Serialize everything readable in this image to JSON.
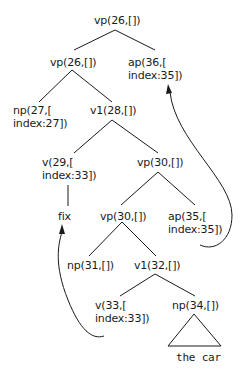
{
  "diagram": {
    "type": "syntax-tree",
    "nodes": {
      "root": {
        "label": "vp(26,[])"
      },
      "vp26": {
        "label": "vp(26,[])"
      },
      "ap36": {
        "line1": "ap(36,[",
        "line2": "index:35])"
      },
      "np27": {
        "line1": "np(27,[",
        "line2": "index:27])"
      },
      "v1_28": {
        "label": "v1(28,[])"
      },
      "v29": {
        "line1": "v(29,[",
        "line2": "index:33])"
      },
      "vp30": {
        "label": "vp(30,[])"
      },
      "fix": {
        "label": "fix"
      },
      "vp30_inner": {
        "label": "vp(30,[])"
      },
      "ap35": {
        "line1": "ap(35,[",
        "line2": "index:35])"
      },
      "np31": {
        "label": "np(31,[])"
      },
      "v1_32": {
        "label": "v1(32,[])"
      },
      "v33": {
        "line1": "v(33,[",
        "line2": "index:33])"
      },
      "np34": {
        "label": "np(34,[])"
      },
      "the_car": {
        "label": "the car"
      }
    },
    "edges": [
      [
        "root",
        "vp26"
      ],
      [
        "root",
        "ap36"
      ],
      [
        "vp26",
        "np27"
      ],
      [
        "vp26",
        "v1_28"
      ],
      [
        "v1_28",
        "v29"
      ],
      [
        "v1_28",
        "vp30"
      ],
      [
        "v29",
        "fix"
      ],
      [
        "vp30",
        "vp30_inner"
      ],
      [
        "vp30",
        "ap35"
      ],
      [
        "vp30_inner",
        "np31"
      ],
      [
        "vp30_inner",
        "v1_32"
      ],
      [
        "v1_32",
        "v33"
      ],
      [
        "v1_32",
        "np34"
      ],
      [
        "np34",
        "the_car",
        "triangle"
      ]
    ],
    "movement_arrows": [
      {
        "from": "ap35",
        "to": "ap36"
      },
      {
        "from": "v33",
        "to": "fix"
      }
    ]
  }
}
